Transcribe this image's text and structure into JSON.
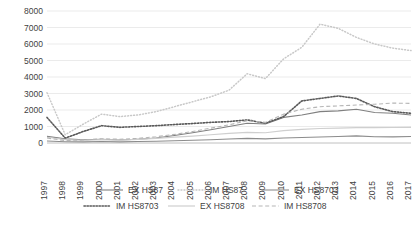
{
  "chart_data": {
    "type": "line",
    "title": "",
    "subtitle": "",
    "xlabel": "",
    "ylabel": "",
    "ylim": [
      0,
      8000
    ],
    "ytick_step": 1000,
    "yticks": [
      "0",
      "1000",
      "2000",
      "3000",
      "4000",
      "5000",
      "6000",
      "7000",
      "8000"
    ],
    "grid": true,
    "legend_position": "bottom",
    "legend_columns": 3,
    "x_tick_rotation": 90,
    "categories": [
      "1997",
      "1998",
      "1999",
      "2000",
      "2001",
      "2002",
      "2003",
      "2004",
      "2005",
      "2006",
      "2007",
      "2008",
      "2009",
      "2010",
      "2011",
      "2012",
      "2013",
      "2014",
      "2015",
      "2016",
      "2017"
    ],
    "series": [
      {
        "name": "EX HS87",
        "style": "solid",
        "color": "#808080",
        "width": 1.1,
        "values": [
          400,
          250,
          200,
          230,
          180,
          230,
          300,
          450,
          620,
          800,
          1000,
          1200,
          1150,
          1550,
          1700,
          1900,
          1950,
          2050,
          1850,
          1800,
          1700
        ]
      },
      {
        "name": "IM HS87",
        "style": "dotted-fine",
        "color": "#c8c8c8",
        "width": 1.5,
        "values": [
          3050,
          500,
          1150,
          1750,
          1600,
          1700,
          1900,
          2200,
          2500,
          2800,
          3200,
          4200,
          3900,
          5100,
          5800,
          7200,
          6950,
          6400,
          6000,
          5750,
          5600
        ]
      },
      {
        "name": "EX HS8703",
        "style": "solid",
        "color": "#8c8c8c",
        "width": 1.1,
        "values": [
          120,
          80,
          70,
          90,
          70,
          90,
          110,
          140,
          170,
          200,
          240,
          280,
          250,
          300,
          330,
          360,
          390,
          430,
          380,
          370,
          390
        ]
      },
      {
        "name": "IM HS8703",
        "style": "dotted-bold",
        "color": "#595959",
        "width": 1.6,
        "values": [
          1550,
          300,
          700,
          1050,
          950,
          1000,
          1050,
          1120,
          1180,
          1250,
          1300,
          1400,
          1200,
          1600,
          2550,
          2700,
          2850,
          2700,
          2200,
          1900,
          1800
        ]
      },
      {
        "name": "EX HS8708",
        "style": "solid",
        "color": "#cfcfcf",
        "width": 1.2,
        "values": [
          350,
          200,
          160,
          200,
          180,
          220,
          280,
          350,
          420,
          500,
          580,
          650,
          620,
          750,
          820,
          880,
          900,
          930,
          930,
          940,
          950
        ]
      },
      {
        "name": "IM HS8708",
        "style": "dashed",
        "color": "#b5b5b5",
        "width": 1.1,
        "values": [
          300,
          150,
          180,
          260,
          230,
          280,
          380,
          520,
          700,
          900,
          1100,
          1350,
          1250,
          1750,
          2050,
          2200,
          2250,
          2300,
          2350,
          2420,
          2400
        ]
      }
    ]
  },
  "legend": {
    "items": [
      {
        "label": "EX HS87"
      },
      {
        "label": "IM HS87"
      },
      {
        "label": "EX HS8703"
      },
      {
        "label": "IM HS8703"
      },
      {
        "label": "EX HS8708"
      },
      {
        "label": "IM HS8708"
      }
    ]
  }
}
